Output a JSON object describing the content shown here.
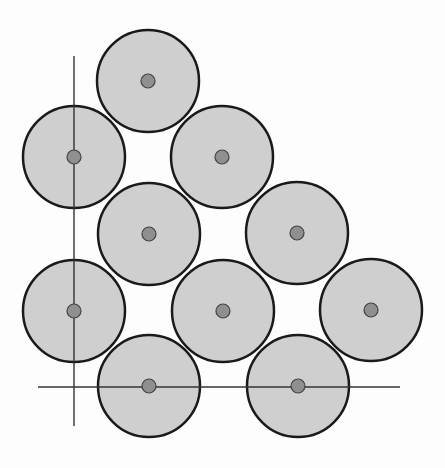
{
  "diagram": {
    "colors": {
      "background": "#fdfdfd",
      "circle_fill": "#cfcfcf",
      "circle_stroke": "#1a1a1a",
      "center_fill": "#8f8f8f",
      "axis_line": "#333333"
    },
    "circle_radius": 51,
    "center_radius": 7,
    "circles": [
      {
        "cx": 148,
        "cy": 81
      },
      {
        "cx": 74,
        "cy": 157
      },
      {
        "cx": 222,
        "cy": 157
      },
      {
        "cx": 149,
        "cy": 234
      },
      {
        "cx": 297,
        "cy": 233
      },
      {
        "cx": 74,
        "cy": 311
      },
      {
        "cx": 223,
        "cy": 311
      },
      {
        "cx": 371,
        "cy": 310
      },
      {
        "cx": 149,
        "cy": 386
      },
      {
        "cx": 298,
        "cy": 386
      }
    ],
    "axes": {
      "vertical": {
        "x": 74,
        "y1": 56,
        "y2": 426
      },
      "horizontal": {
        "y": 387,
        "x1": 38,
        "x2": 400
      }
    }
  }
}
